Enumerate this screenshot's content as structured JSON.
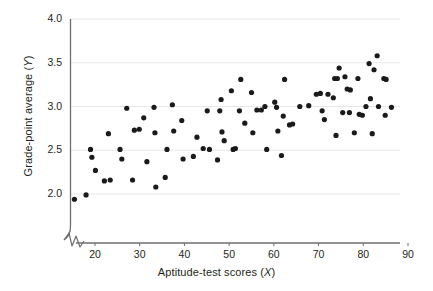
{
  "chart_data": {
    "type": "scatter",
    "title": "",
    "xlabel": "Aptitude-test scores (X)",
    "ylabel": "Grade-point average (Y)",
    "xlim": [
      14,
      90
    ],
    "ylim": [
      1.72,
      4.0
    ],
    "x_axis_break": true,
    "grid": "horizontal",
    "legend": "none",
    "marker": {
      "shape": "circle",
      "color": "#1a1a1a",
      "size_px": 3.4
    },
    "xticks": [
      20,
      30,
      40,
      50,
      60,
      70,
      80,
      90
    ],
    "xtick_labels": [
      "20",
      "30",
      "40",
      "50",
      "60",
      "70",
      "80",
      "90"
    ],
    "yticks": [
      2.0,
      2.5,
      3.0,
      3.5,
      4.0
    ],
    "ytick_labels": [
      "2.0",
      "2.5",
      "3.0",
      "3.5",
      "4.0"
    ],
    "n_points": 87,
    "points": [
      [
        15.4,
        1.94
      ],
      [
        18.0,
        1.99
      ],
      [
        19.0,
        2.51
      ],
      [
        19.3,
        2.42
      ],
      [
        20.1,
        2.27
      ],
      [
        22.1,
        2.15
      ],
      [
        23.0,
        2.69
      ],
      [
        25.6,
        2.51
      ],
      [
        26.0,
        2.4
      ],
      [
        27.1,
        2.98
      ],
      [
        28.4,
        2.16
      ],
      [
        28.8,
        2.73
      ],
      [
        30.9,
        2.87
      ],
      [
        31.6,
        2.37
      ],
      [
        33.2,
        2.99
      ],
      [
        33.4,
        2.7
      ],
      [
        33.6,
        2.08
      ],
      [
        35.7,
        2.19
      ],
      [
        36.1,
        2.51
      ],
      [
        37.3,
        3.02
      ],
      [
        37.6,
        2.72
      ],
      [
        39.4,
        2.84
      ],
      [
        39.7,
        2.4
      ],
      [
        42.0,
        2.43
      ],
      [
        42.8,
        2.65
      ],
      [
        45.1,
        2.95
      ],
      [
        45.6,
        2.51
      ],
      [
        47.4,
        2.39
      ],
      [
        47.9,
        2.95
      ],
      [
        48.2,
        3.08
      ],
      [
        48.4,
        2.71
      ],
      [
        48.9,
        2.61
      ],
      [
        50.5,
        3.18
      ],
      [
        50.9,
        2.51
      ],
      [
        52.3,
        2.95
      ],
      [
        52.6,
        3.31
      ],
      [
        53.5,
        2.81
      ],
      [
        55.0,
        3.16
      ],
      [
        55.3,
        2.7
      ],
      [
        56.2,
        2.96
      ],
      [
        58.0,
        3.0
      ],
      [
        58.4,
        2.51
      ],
      [
        60.2,
        3.05
      ],
      [
        60.6,
        2.99
      ],
      [
        60.9,
        2.72
      ],
      [
        61.7,
        2.44
      ],
      [
        62.1,
        2.89
      ],
      [
        62.4,
        3.31
      ],
      [
        63.5,
        2.79
      ],
      [
        65.8,
        3.0
      ],
      [
        69.5,
        3.14
      ],
      [
        70.4,
        3.15
      ],
      [
        70.8,
        2.95
      ],
      [
        71.3,
        2.85
      ],
      [
        73.3,
        3.1
      ],
      [
        73.6,
        3.32
      ],
      [
        73.9,
        2.67
      ],
      [
        74.6,
        3.44
      ],
      [
        75.4,
        2.93
      ],
      [
        75.9,
        3.34
      ],
      [
        76.4,
        3.2
      ],
      [
        76.9,
        2.93
      ],
      [
        77.1,
        3.19
      ],
      [
        78.0,
        2.7
      ],
      [
        78.8,
        3.32
      ],
      [
        79.8,
        2.9
      ],
      [
        80.6,
        3.0
      ],
      [
        81.3,
        3.49
      ],
      [
        81.6,
        3.09
      ],
      [
        82.0,
        2.69
      ],
      [
        82.4,
        3.42
      ],
      [
        83.1,
        3.58
      ],
      [
        84.6,
        3.32
      ],
      [
        84.9,
        2.9
      ],
      [
        86.3,
        2.99
      ],
      [
        23.4,
        2.16
      ],
      [
        29.9,
        2.74
      ],
      [
        44.2,
        2.52
      ],
      [
        51.4,
        2.52
      ],
      [
        57.2,
        2.96
      ],
      [
        64.2,
        2.8
      ],
      [
        67.8,
        3.01
      ],
      [
        72.1,
        3.14
      ],
      [
        74.2,
        3.32
      ],
      [
        79.1,
        2.91
      ],
      [
        83.4,
        3.0
      ],
      [
        85.1,
        3.31
      ]
    ]
  }
}
